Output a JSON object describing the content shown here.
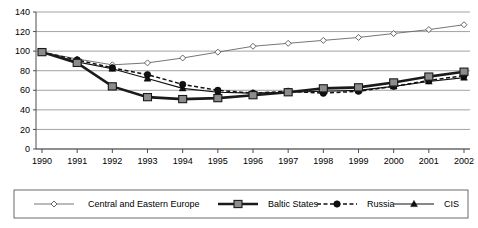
{
  "chart_data": {
    "type": "line",
    "title": "",
    "xlabel": "",
    "ylabel": "",
    "xlim": [
      1990,
      2002
    ],
    "ylim": [
      0,
      140
    ],
    "ytick_step": 20,
    "grid": true,
    "legend_position": "bottom",
    "categories": [
      "1990",
      "1991",
      "1992",
      "1993",
      "1994",
      "1995",
      "1996",
      "1997",
      "1998",
      "1999",
      "2000",
      "2001",
      "2002"
    ],
    "yticks": [
      "0",
      "20",
      "40",
      "60",
      "80",
      "100",
      "120",
      "140"
    ],
    "series": [
      {
        "name": "Central and Eastern Europe",
        "marker": "diamond-open",
        "line": "solid-thin",
        "color": "#666666",
        "values": [
          99,
          92,
          86,
          88,
          93,
          99,
          105,
          108,
          111,
          114,
          118,
          122,
          127
        ]
      },
      {
        "name": "Baltic States",
        "marker": "square-filled",
        "line": "solid-thick",
        "color": "#222222",
        "values": [
          99,
          88,
          64,
          53,
          51,
          52,
          55,
          58,
          62,
          63,
          68,
          74,
          79
        ]
      },
      {
        "name": "Russia",
        "marker": "circle-filled",
        "line": "dashed",
        "color": "#111111",
        "values": [
          99,
          91,
          83,
          76,
          66,
          60,
          57,
          59,
          57,
          59,
          64,
          70,
          75
        ]
      },
      {
        "name": "CIS",
        "marker": "triangle-filled",
        "line": "solid-thin-dark",
        "color": "#111111",
        "values": [
          99,
          89,
          82,
          72,
          62,
          58,
          57,
          58,
          59,
          60,
          64,
          69,
          73
        ]
      }
    ]
  },
  "legend": {
    "items": [
      {
        "label": "Central and Eastern Europe",
        "key": "cee"
      },
      {
        "label": "Baltic States",
        "key": "baltic"
      },
      {
        "label": "Russia",
        "key": "russia"
      },
      {
        "label": "CIS",
        "key": "cis"
      }
    ]
  }
}
